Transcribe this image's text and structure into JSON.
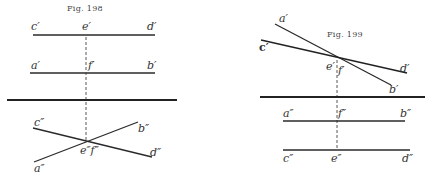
{
  "figures": [
    {
      "caption": "Fig. 198",
      "labels": {
        "c1": "c′",
        "e1": "e′",
        "d1": "d′",
        "a1": "a′",
        "f1": "f′",
        "b1": "b′",
        "c2": "c″",
        "b2": "b″",
        "ef2": "e″f″",
        "d2": "d″",
        "a2": "a″"
      }
    },
    {
      "caption": "Fig. 199",
      "labels": {
        "a1": "a′",
        "c1": "c′",
        "e1": "e′",
        "f1": "f′",
        "d1": "d′",
        "b1": "b′",
        "a2": "a″",
        "f2": "f″",
        "b2": "b″",
        "c2": "c″",
        "e2": "e″",
        "d2": "d″"
      }
    }
  ]
}
